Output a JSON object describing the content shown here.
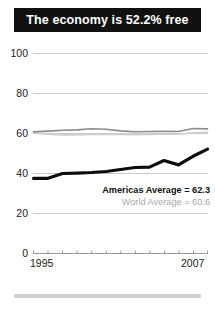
{
  "title": "The economy is 52.2% free",
  "colors": {
    "banner_bg": "#111111",
    "banner_text": "#ffffff",
    "country_line": "#0d0d0d",
    "americas_line": "#8c8c8c",
    "world_line": "#cfcfcf",
    "grid": "#c9c9c9",
    "axis": "#9a9a9a",
    "footer_bar": "#d2d2d2"
  },
  "legend": {
    "americas": "Americas Average = 62.3",
    "world": "World Average = 60.6"
  },
  "axis": {
    "y_ticks": [
      "0",
      "20",
      "40",
      "60",
      "80",
      "100"
    ],
    "x_start_label": "1995",
    "x_end_label": "2007"
  },
  "chart_data": {
    "type": "line",
    "title": "The economy is 52.2% free",
    "xlabel": "",
    "ylabel": "",
    "xlim": [
      1995,
      2007
    ],
    "ylim": [
      0,
      100
    ],
    "grid": true,
    "legend_position": "inside-right",
    "x": [
      1995,
      1996,
      1997,
      1998,
      1999,
      2000,
      2001,
      2002,
      2003,
      2004,
      2005,
      2006,
      2007
    ],
    "series": [
      {
        "name": "Country score",
        "style": "bold-black",
        "values": [
          37.6,
          37.6,
          40.0,
          40.2,
          40.5,
          41.0,
          42.0,
          43.0,
          43.2,
          46.5,
          44.3,
          48.6,
          52.2
        ]
      },
      {
        "name": "Americas Average = 62.3",
        "style": "medium-gray",
        "values": [
          60.8,
          61.2,
          61.6,
          61.8,
          62.4,
          62.1,
          61.3,
          60.9,
          61.0,
          61.1,
          61.0,
          62.5,
          62.3
        ]
      },
      {
        "name": "World Average = 60.6",
        "style": "light-gray",
        "values": [
          60.2,
          59.6,
          59.3,
          59.3,
          59.5,
          59.6,
          59.5,
          59.4,
          59.5,
          59.6,
          59.6,
          60.3,
          60.6
        ]
      }
    ],
    "annotations": [
      {
        "text": "Americas Average = 62.3",
        "emphasis": "bold"
      },
      {
        "text": "World Average = 60.6",
        "emphasis": "normal"
      }
    ]
  }
}
